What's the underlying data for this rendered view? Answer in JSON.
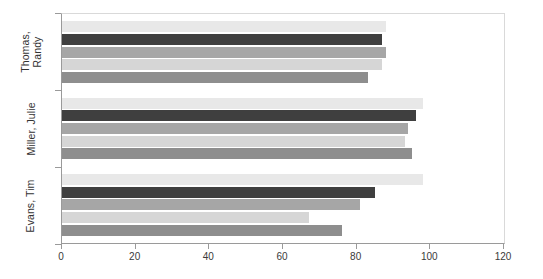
{
  "chart_data": {
    "type": "bar",
    "orientation": "horizontal",
    "title": "",
    "xlabel": "",
    "ylabel": "",
    "categories": [
      "Thomas, Randy",
      "Miller, Julie",
      "Evans, Tim"
    ],
    "category_label_lines": [
      [
        "Thomas,",
        "Randy"
      ],
      [
        "Miller, Julie"
      ],
      [
        "Evans, Tim"
      ]
    ],
    "xlim": [
      0,
      120
    ],
    "xticks": [
      0,
      20,
      40,
      60,
      80,
      100,
      120
    ],
    "xtick_labels": [
      "0",
      "20",
      "40",
      "60",
      "80",
      "100",
      "120"
    ],
    "grid": false,
    "legend": "none",
    "series": [
      {
        "name": "Series 1",
        "color": "#e8e8e8",
        "values": [
          88,
          98,
          98
        ]
      },
      {
        "name": "Series 2",
        "color": "#3f3f3f",
        "values": [
          87,
          96,
          85
        ]
      },
      {
        "name": "Series 3",
        "color": "#a6a6a6",
        "values": [
          88,
          94,
          81
        ]
      },
      {
        "name": "Series 4",
        "color": "#d6d6d6",
        "values": [
          87,
          93,
          67
        ]
      },
      {
        "name": "Series 5",
        "color": "#8e8e8e",
        "values": [
          83,
          95,
          76
        ]
      }
    ]
  },
  "axis": {
    "x_min_label": "0",
    "x_max_label": "120"
  }
}
